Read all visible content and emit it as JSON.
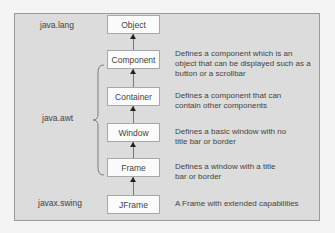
{
  "diagram": {
    "packages": [
      {
        "id": "java-lang",
        "label": "java.lang"
      },
      {
        "id": "java-awt",
        "label": "java.awt"
      },
      {
        "id": "javax-swing",
        "label": "javax.swing"
      }
    ],
    "classes": [
      {
        "label": "Object",
        "description": ""
      },
      {
        "label": "Component",
        "description": "Defines a component which is an object that can be displayed such as a button or a scrollbar"
      },
      {
        "label": "Container",
        "description": "Defines a component that can contain other components"
      },
      {
        "label": "Window",
        "description": "Defines a basic window with no title bar or border"
      },
      {
        "label": "Frame",
        "description": "Defines a window with a title bar or border"
      },
      {
        "label": "JFrame",
        "description": "A Frame with extended capabilities"
      }
    ],
    "colors": {
      "background": "#dcdcdc",
      "box": "#fbfbfb",
      "border": "#9a9a9a"
    }
  }
}
